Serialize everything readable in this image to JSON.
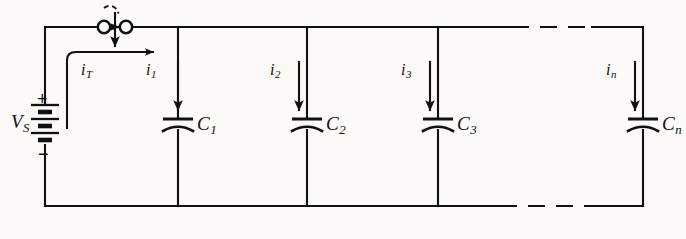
{
  "figure": {
    "kind": "circuit-schematic",
    "background_color": "#fbfaf6",
    "ink_color": "#111111"
  },
  "source": {
    "name": "voltage-source",
    "label_main": "V",
    "label_sub": "S",
    "plus_sign": "+",
    "minus_sign": "−",
    "symbol": "battery-multicell"
  },
  "switch": {
    "name": "closing-switch",
    "symbol": "two-terminal-closing-switch",
    "state": "open",
    "has_closing_arc": true
  },
  "currents": [
    {
      "label_main": "i",
      "label_sub": "T",
      "direction": "right",
      "arrow": "curved"
    },
    {
      "label_main": "i",
      "label_sub": "1",
      "direction": "down",
      "arrow": "straight"
    },
    {
      "label_main": "i",
      "label_sub": "2",
      "direction": "down",
      "arrow": "straight"
    },
    {
      "label_main": "i",
      "label_sub": "3",
      "direction": "down",
      "arrow": "straight"
    },
    {
      "label_main": "i",
      "label_sub": "n",
      "direction": "down",
      "arrow": "straight"
    }
  ],
  "capacitors": [
    {
      "label_main": "C",
      "label_sub": "1"
    },
    {
      "label_main": "C",
      "label_sub": "2"
    },
    {
      "label_main": "C",
      "label_sub": "3"
    },
    {
      "label_main": "C",
      "label_sub": "n"
    }
  ],
  "rails": {
    "top": {
      "name": "top-rail",
      "dashed_gap": true
    },
    "bottom": {
      "name": "bottom-rail",
      "dashed_gap": true
    }
  }
}
